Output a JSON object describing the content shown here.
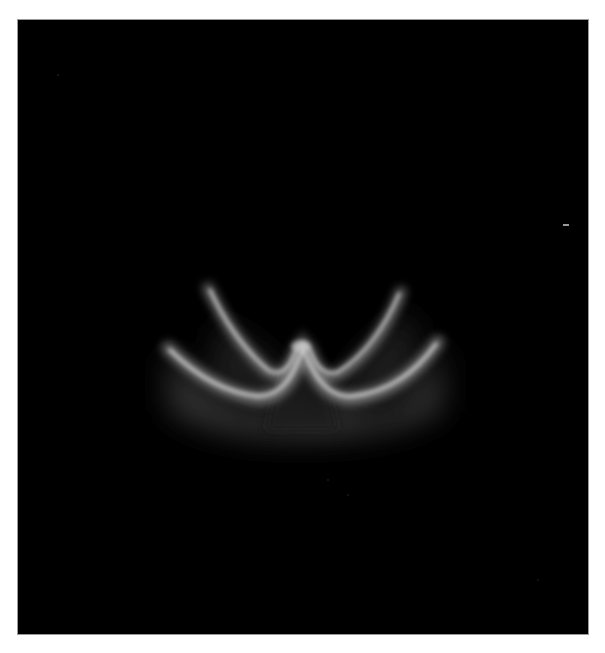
{
  "image": {
    "description": "Grayscale glowing curved band structure on a black background",
    "background_color": "#000000",
    "border_color": "#9a9a9a",
    "page_color": "#ffffff",
    "glow_color": "#d8d8d8"
  }
}
